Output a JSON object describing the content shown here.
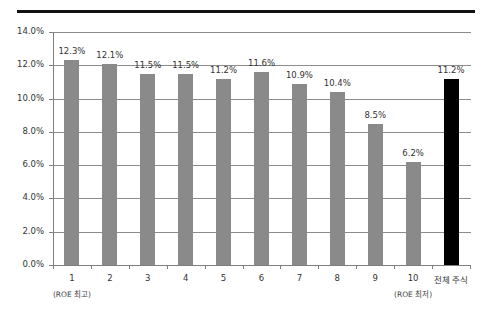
{
  "chart_data": {
    "type": "bar",
    "title": "",
    "xlabel": "",
    "ylabel": "",
    "ylim": [
      0,
      14
    ],
    "yticks": [
      "0.0%",
      "2.0%",
      "4.0%",
      "6.0%",
      "8.0%",
      "10.0%",
      "12.0%",
      "14.0%"
    ],
    "grid": true,
    "categories": [
      "1",
      "2",
      "3",
      "4",
      "5",
      "6",
      "7",
      "8",
      "9",
      "10",
      "전체 주식"
    ],
    "category_sublabels": {
      "0": "(ROE 최고)",
      "9": "(ROE 최저)"
    },
    "values": [
      12.3,
      12.1,
      11.5,
      11.5,
      11.2,
      11.6,
      10.9,
      10.4,
      8.5,
      6.2,
      11.2
    ],
    "value_labels": [
      "12.3%",
      "12.1%",
      "11.5%",
      "11.5%",
      "11.2%",
      "11.6%",
      "10.9%",
      "10.4%",
      "8.5%",
      "6.2%",
      "11.2%"
    ],
    "bar_colors": [
      "#8a8a8a",
      "#8a8a8a",
      "#8a8a8a",
      "#8a8a8a",
      "#8a8a8a",
      "#8a8a8a",
      "#8a8a8a",
      "#8a8a8a",
      "#8a8a8a",
      "#8a8a8a",
      "#000000"
    ],
    "legend": null
  },
  "header": {
    "title_clipped": ""
  }
}
